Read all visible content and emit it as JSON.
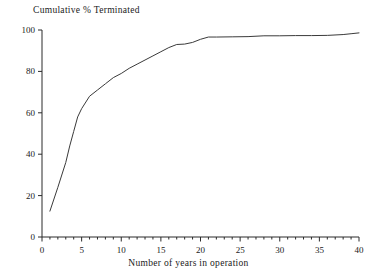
{
  "chart_data": {
    "type": "line",
    "title": "",
    "ylabel": "Cumulative % Terminated",
    "xlabel": "Number of years in operation",
    "xlim": [
      0,
      40
    ],
    "ylim": [
      0,
      100
    ],
    "xticks": [
      0,
      5,
      10,
      15,
      20,
      25,
      30,
      35,
      40
    ],
    "yticks": [
      0,
      20,
      40,
      60,
      80,
      100
    ],
    "xtick_labels": [
      "0",
      "5",
      "10",
      "15",
      "20",
      "25",
      "30",
      "35",
      "40"
    ],
    "ytick_labels": [
      "0",
      "20",
      "40",
      "60",
      "80",
      "100"
    ],
    "minor_xtick_interval": 1,
    "grid": false,
    "legend": null,
    "line_color": "#3a3a3a",
    "line_width": 1,
    "x": [
      1,
      2,
      3,
      3.5,
      4,
      4.5,
      5,
      6,
      7,
      8,
      9,
      10,
      11,
      12,
      13,
      14,
      15,
      16,
      17,
      18,
      19,
      20,
      21,
      22,
      24,
      26,
      28,
      30,
      32,
      34,
      36,
      38,
      39,
      40
    ],
    "y": [
      12.5,
      24,
      36,
      44,
      51,
      58,
      62,
      68,
      71,
      74,
      77,
      79,
      81.5,
      83.5,
      85.5,
      87.5,
      89.5,
      91.5,
      93,
      93.2,
      94,
      95.5,
      96.6,
      96.6,
      96.7,
      96.8,
      97.2,
      97.2,
      97.3,
      97.3,
      97.4,
      97.8,
      98.2,
      98.6
    ],
    "series": [
      {
        "name": "Cumulative % Terminated",
        "points": [
          [
            1,
            12.5
          ],
          [
            2,
            24
          ],
          [
            3,
            36
          ],
          [
            3.5,
            44
          ],
          [
            4,
            51
          ],
          [
            4.5,
            58
          ],
          [
            5,
            62
          ],
          [
            6,
            68
          ],
          [
            7,
            71
          ],
          [
            8,
            74
          ],
          [
            9,
            77
          ],
          [
            10,
            79
          ],
          [
            11,
            81.5
          ],
          [
            12,
            83.5
          ],
          [
            13,
            85.5
          ],
          [
            14,
            87.5
          ],
          [
            15,
            89.5
          ],
          [
            16,
            91.5
          ],
          [
            17,
            93
          ],
          [
            18,
            93.2
          ],
          [
            19,
            94
          ],
          [
            20,
            95.5
          ],
          [
            21,
            96.6
          ],
          [
            22,
            96.6
          ],
          [
            24,
            96.7
          ],
          [
            26,
            96.8
          ],
          [
            28,
            97.2
          ],
          [
            30,
            97.2
          ],
          [
            32,
            97.3
          ],
          [
            34,
            97.3
          ],
          [
            36,
            97.4
          ],
          [
            38,
            97.8
          ],
          [
            39,
            98.2
          ],
          [
            40,
            98.6
          ]
        ]
      }
    ]
  },
  "axes": {
    "y_title": "Cumulative % Terminated",
    "x_title": "Number of years in operation"
  }
}
